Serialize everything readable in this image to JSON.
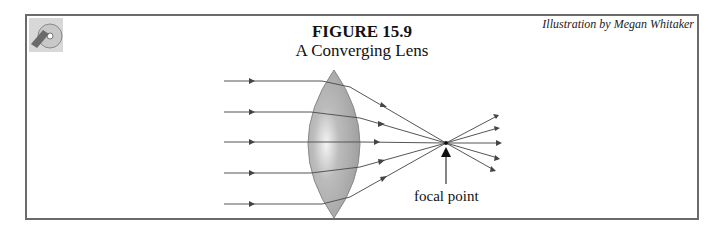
{
  "figure": {
    "number_label": "FIGURE 15.9",
    "title": "A Converging Lens",
    "credit": "Illustration by Megan Whitaker",
    "logo_icon": "cd-disc-icon"
  },
  "diagram": {
    "lens": {
      "type": "converging (biconvex)",
      "color": "#a9a9a9"
    },
    "incoming_rays": 5,
    "focal_point_label": "focal point",
    "ray_color": "#555555",
    "frame_color": "#6b6b6b"
  }
}
